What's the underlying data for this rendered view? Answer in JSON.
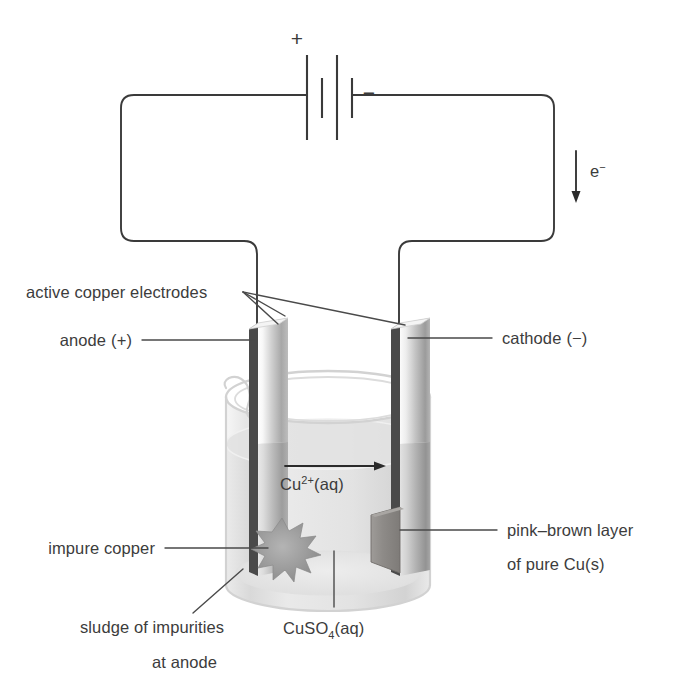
{
  "diagram": {
    "background_color": "#ffffff",
    "ink_color": "#3c3c3c"
  },
  "circuit": {
    "battery": {
      "positive_sign": "+",
      "negative_sign": "−",
      "cell_count": 2
    },
    "electron_flow": {
      "label": "e",
      "label_superscript": "−",
      "direction": "down"
    }
  },
  "labels": {
    "active_electrodes": "active copper electrodes",
    "anode": "anode (+)",
    "anode_text": "anode",
    "anode_charge": "(+)",
    "cathode": "cathode (−)",
    "cathode_text": "cathode",
    "cathode_charge": "(−)",
    "impure_copper": "impure copper",
    "sludge_line1": "sludge of impurities",
    "sludge_line2": "at anode",
    "pink_brown_line1": "pink–brown layer",
    "pink_brown_line2": "of pure Cu(s)",
    "electrolyte_formula": "CuSO",
    "electrolyte_subscript": "4",
    "electrolyte_state": "(aq)",
    "ion_formula": "Cu",
    "ion_superscript": "2+",
    "ion_state": "(aq)"
  },
  "colors": {
    "ink": "#3c3c3c",
    "wire": "#3a3a3a",
    "glass": "#d2d2d2",
    "electrode_dark": "#8d8d8d",
    "electrode_light": "#f2f2f2",
    "solution": "#e6e6e6",
    "sludge": "#9a9a9a"
  }
}
